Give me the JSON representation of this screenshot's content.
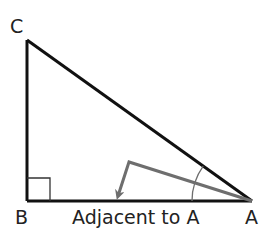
{
  "diagram": {
    "type": "right-triangle",
    "vertices": {
      "A": {
        "label": "A",
        "x": 252,
        "y": 201
      },
      "B": {
        "label": "B",
        "x": 27,
        "y": 201
      },
      "C": {
        "label": "C",
        "x": 27,
        "y": 40
      }
    },
    "right_angle_at": "B",
    "angle_marked_at": "A",
    "side_labels": {
      "BA": "Adjacent to A"
    },
    "arrow": {
      "description": "gray arrow from angle A pointing to the adjacent side",
      "color": "#6e6e6e"
    },
    "colors": {
      "triangle_stroke": "#111111",
      "arrow_stroke": "#6e6e6e",
      "arc_stroke": "#6e6e6e",
      "text": "#222222"
    }
  }
}
